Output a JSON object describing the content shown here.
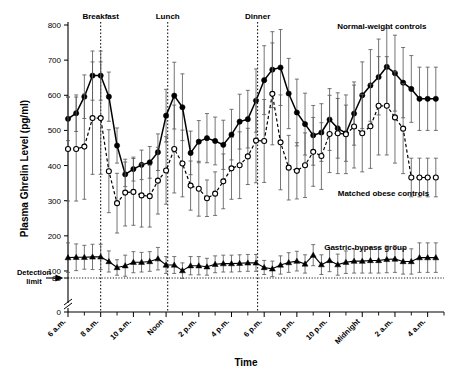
{
  "figure": {
    "panel_label": "",
    "detection_limit_label_line1": "Detection",
    "detection_limit_label_line2": "limit"
  },
  "chart_data": {
    "type": "line",
    "title": "",
    "xlabel": "Time",
    "ylabel": "Plasma Ghrelin Level (pg/ml)",
    "grid": false,
    "legend_position": "inline-annotations",
    "ylim": [
      0,
      800
    ],
    "y_ticks": [
      0,
      80,
      100,
      200,
      300,
      400,
      500,
      600,
      700,
      800
    ],
    "y_axis_break_after": 0,
    "xlim": [
      6,
      29
    ],
    "x_tick_labels": [
      "6 a.m.",
      "8 a.m.",
      "10 a.m.",
      "Noon",
      "2 p.m.",
      "4 p.m.",
      "6 p.m.",
      "8 p.m.",
      "10 p.m.",
      "Midnight",
      "2 a.m.",
      "4 a.m."
    ],
    "x_tick_hours": [
      6,
      8,
      10,
      12,
      14,
      16,
      18,
      20,
      22,
      24,
      26,
      28
    ],
    "detection_limit_value": 80,
    "annotations": [
      {
        "label": "Breakfast",
        "hour": 8.0
      },
      {
        "label": "Lunch",
        "hour": 12.1
      },
      {
        "label": "Dinner",
        "hour": 17.6
      }
    ],
    "x": [
      6.0,
      6.5,
      7.0,
      7.5,
      8.0,
      8.5,
      9.0,
      9.5,
      10.0,
      10.5,
      11.0,
      11.5,
      12.0,
      12.5,
      13.0,
      13.5,
      14.0,
      14.5,
      15.0,
      15.5,
      16.0,
      16.5,
      17.0,
      17.5,
      18.0,
      18.5,
      19.0,
      19.5,
      20.0,
      20.5,
      21.0,
      21.5,
      22.0,
      22.5,
      23.0,
      23.5,
      24.0,
      24.5,
      25.0,
      25.5,
      26.0,
      26.5,
      27.0,
      27.5,
      28.0,
      28.5
    ],
    "series": [
      {
        "name": "Normal-weight controls",
        "marker": "filled-circle",
        "linestyle": "solid",
        "label_hour": 25.2,
        "label_value": 790,
        "values": [
          533,
          549,
          596,
          656,
          656,
          596,
          457,
          375,
          390,
          402,
          409,
          438,
          542,
          599,
          566,
          436,
          468,
          478,
          470,
          459,
          488,
          525,
          532,
          585,
          643,
          673,
          679,
          605,
          551,
          518,
          486,
          494,
          531,
          506,
          492,
          548,
          600,
          628,
          652,
          681,
          663,
          636,
          618,
          590,
          590,
          590
        ],
        "err": [
          62,
          52,
          62,
          70,
          70,
          70,
          50,
          35,
          34,
          42,
          45,
          52,
          75,
          95,
          95,
          62,
          60,
          70,
          68,
          70,
          72,
          78,
          82,
          90,
          98,
          108,
          108,
          100,
          95,
          88,
          85,
          82,
          88,
          85,
          80,
          90,
          95,
          102,
          108,
          110,
          108,
          100,
          95,
          90,
          90,
          90
        ]
      },
      {
        "name": "Matched obese controls",
        "marker": "open-circle",
        "linestyle": "dashed",
        "label_hour": 25.3,
        "label_value": 313,
        "values": [
          447,
          447,
          454,
          535,
          535,
          384,
          293,
          323,
          325,
          315,
          313,
          357,
          386,
          447,
          406,
          343,
          334,
          307,
          320,
          355,
          392,
          401,
          426,
          471,
          470,
          604,
          466,
          394,
          385,
          401,
          439,
          427,
          490,
          492,
          489,
          511,
          492,
          512,
          570,
          570,
          537,
          505,
          366,
          366,
          366,
          366
        ],
        "err": [
          148,
          148,
          150,
          160,
          160,
          118,
          85,
          95,
          95,
          90,
          88,
          95,
          96,
          125,
          95,
          70,
          78,
          52,
          62,
          78,
          88,
          95,
          80,
          120,
          118,
          145,
          135,
          92,
          80,
          92,
          98,
          95,
          110,
          115,
          112,
          118,
          110,
          120,
          140,
          140,
          130,
          128,
          55,
          55,
          55,
          55
        ]
      },
      {
        "name": "Gastric-bypass group",
        "marker": "filled-triangle",
        "linestyle": "thin",
        "label_hour": 24.2,
        "label_value": 160,
        "values": [
          138,
          139,
          139,
          140,
          140,
          127,
          110,
          115,
          125,
          125,
          127,
          135,
          117,
          117,
          101,
          115,
          115,
          112,
          119,
          121,
          121,
          122,
          123,
          123,
          110,
          106,
          117,
          124,
          128,
          120,
          145,
          118,
          130,
          118,
          125,
          128,
          128,
          130,
          130,
          133,
          134,
          127,
          127,
          138,
          138,
          138
        ],
        "err": [
          42,
          38,
          34,
          36,
          36,
          30,
          22,
          30,
          30,
          28,
          28,
          32,
          24,
          24,
          22,
          26,
          26,
          24,
          24,
          24,
          24,
          24,
          24,
          24,
          20,
          22,
          26,
          28,
          28,
          26,
          30,
          28,
          32,
          30,
          32,
          34,
          34,
          36,
          36,
          38,
          38,
          36,
          36,
          42,
          42,
          42
        ]
      }
    ]
  }
}
